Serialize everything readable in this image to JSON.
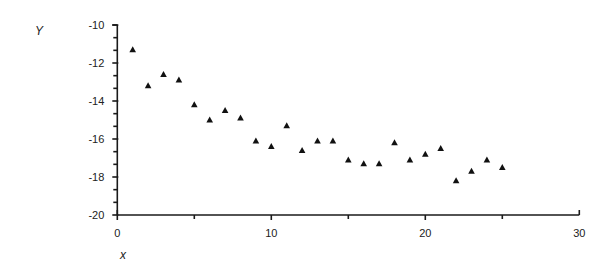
{
  "chart_data": {
    "type": "scatter",
    "title": "",
    "xlabel": "x",
    "ylabel": "Y",
    "xlim": [
      0,
      30
    ],
    "ylim": [
      -20,
      -10
    ],
    "x_ticks": [
      0,
      10,
      20,
      30
    ],
    "x_tick_labels": [
      "0",
      "10",
      "20",
      "30"
    ],
    "x_minor_ticks": [
      5,
      15,
      25
    ],
    "y_ticks": [
      -10,
      -12,
      -14,
      -16,
      -18,
      -20
    ],
    "y_tick_labels": [
      "-10",
      "-12",
      "-14",
      "-16",
      "-18",
      "-20"
    ],
    "y_minor_step": 0.6667,
    "grid": false,
    "legend": null,
    "marker": "triangle",
    "marker_color": "#111111",
    "series": [
      {
        "name": "Y",
        "x": [
          1,
          2,
          3,
          4,
          5,
          6,
          7,
          8,
          9,
          10,
          11,
          12,
          13,
          14,
          15,
          16,
          17,
          18,
          19,
          20,
          21,
          22,
          23,
          24,
          25
        ],
        "y": [
          -11.3,
          -13.2,
          -12.6,
          -12.9,
          -14.2,
          -15.0,
          -14.5,
          -14.9,
          -16.1,
          -16.4,
          -15.3,
          -16.6,
          -16.1,
          -16.1,
          -17.1,
          -17.3,
          -17.3,
          -16.2,
          -17.1,
          -16.8,
          -16.5,
          -18.2,
          -17.7,
          -17.1,
          -17.5
        ]
      }
    ]
  }
}
